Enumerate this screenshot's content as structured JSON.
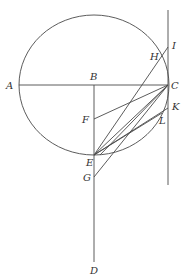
{
  "diagram": {
    "type": "geometry",
    "stroke_color": "#4a4a4a",
    "labels": {
      "A": "A",
      "B": "B",
      "C": "C",
      "D": "D",
      "E": "E",
      "F": "F",
      "G": "G",
      "H": "H",
      "I": "I",
      "K": "K",
      "L": "L"
    },
    "points": {
      "A": [
        19,
        85
      ],
      "B": [
        94,
        85
      ],
      "C": [
        168,
        85
      ],
      "D": [
        94,
        262
      ],
      "E": [
        94,
        155
      ],
      "F": [
        94,
        119
      ],
      "G": [
        94,
        177
      ],
      "H": [
        161,
        57
      ],
      "I": [
        168,
        47
      ],
      "K": [
        168,
        108
      ],
      "L": [
        162,
        113
      ]
    },
    "circle": {
      "cx": 94,
      "cy": 85,
      "rx": 75,
      "ry": 70
    }
  }
}
